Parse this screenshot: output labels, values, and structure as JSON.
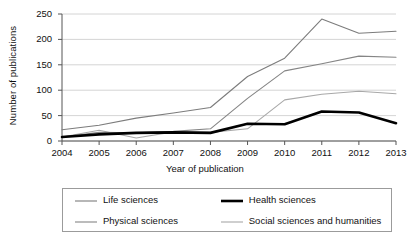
{
  "chart_data": {
    "type": "line",
    "title": "",
    "xlabel": "Year of publication",
    "ylabel": "Number of publications",
    "categories": [
      "2004",
      "2005",
      "2006",
      "2007",
      "2008",
      "2009",
      "2010",
      "2011",
      "2012",
      "2013"
    ],
    "x": [
      2004,
      2005,
      2006,
      2007,
      2008,
      2009,
      2010,
      2011,
      2012,
      2013
    ],
    "xlim": [
      2004,
      2013
    ],
    "ylim": [
      0,
      250
    ],
    "yticks": [
      0,
      50,
      100,
      150,
      200,
      250
    ],
    "grid": "horizontal",
    "legend_position": "bottom",
    "series": [
      {
        "name": "Life sciences",
        "color": "#7c7c7c",
        "width": 1.1,
        "values": [
          22,
          31,
          45,
          55,
          66,
          127,
          163,
          240,
          212,
          216
        ]
      },
      {
        "name": "Health sciences",
        "color": "#000000",
        "width": 2.6,
        "values": [
          8,
          13,
          16,
          17,
          16,
          34,
          33,
          58,
          56,
          35
        ]
      },
      {
        "name": "Physical sciences",
        "color": "#858585",
        "width": 1.1,
        "values": [
          8,
          17,
          16,
          19,
          24,
          84,
          138,
          152,
          167,
          165
        ]
      },
      {
        "name": "Social sciences and humanities",
        "color": "#a8a8a8",
        "width": 1.1,
        "values": [
          8,
          21,
          6,
          18,
          17,
          24,
          81,
          92,
          98,
          93
        ]
      }
    ]
  },
  "legend": {
    "entries": [
      {
        "label": "Life sciences"
      },
      {
        "label": "Health sciences"
      },
      {
        "label": "Physical sciences"
      },
      {
        "label": "Social sciences and humanities"
      }
    ]
  }
}
